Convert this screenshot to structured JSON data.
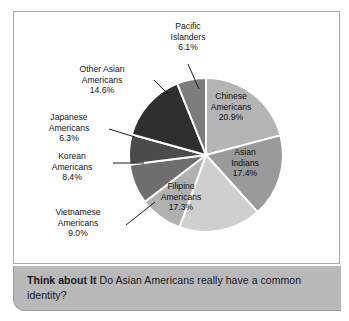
{
  "caption": {
    "lead": "Think about It",
    "question": "Do Asian Americans really have a common identity?"
  },
  "chart_data": {
    "type": "pie",
    "title": "",
    "xlabel": "",
    "ylabel": "",
    "legend_position": "none",
    "grid": false,
    "units": "percent",
    "start_angle_deg": 0,
    "direction": "clockwise",
    "categories": [
      "Chinese Americans",
      "Asian Indians",
      "Filipino Americans",
      "Vietnamese Americans",
      "Korean Americans",
      "Japanese Americans",
      "Other Asian Americans",
      "Pacific Islanders"
    ],
    "values": [
      20.9,
      17.4,
      17.3,
      9.0,
      8.4,
      6.3,
      14.6,
      6.1
    ],
    "value_labels": [
      "20.9%",
      "17.4%",
      "17.3%",
      "9.0%",
      "8.4%",
      "6.3%",
      "14.6%",
      "6.1%"
    ],
    "colors": [
      "#b4b4b4",
      "#9a9a9a",
      "#cfcfcf",
      "#b0b0b0",
      "#6e6e6e",
      "#4b4b4b",
      "#2f2f2f",
      "#7d7d7d"
    ],
    "slice_separator_color": "#ffffff",
    "slices": [
      {
        "name": "Chinese Americans",
        "line1": "Chinese",
        "line2": "Americans",
        "pct": "20.9%",
        "value": 20.9,
        "color": "#b4b4b4",
        "label_placement": "inside"
      },
      {
        "name": "Asian Indians",
        "line1": "Asian",
        "line2": "Indians",
        "pct": "17.4%",
        "value": 17.4,
        "color": "#9a9a9a",
        "label_placement": "inside"
      },
      {
        "name": "Filipino Americans",
        "line1": "Filipino",
        "line2": "Americans",
        "pct": "17.3%",
        "value": 17.3,
        "color": "#cfcfcf",
        "label_placement": "inside"
      },
      {
        "name": "Vietnamese Americans",
        "line1": "Vietnamese",
        "line2": "Americans",
        "pct": "9.0%",
        "value": 9.0,
        "color": "#b0b0b0",
        "label_placement": "outside"
      },
      {
        "name": "Korean Americans",
        "line1": "Korean",
        "line2": "Americans",
        "pct": "8.4%",
        "value": 8.4,
        "color": "#6e6e6e",
        "label_placement": "outside"
      },
      {
        "name": "Japanese Americans",
        "line1": "Japanese",
        "line2": "Americans",
        "pct": "6.3%",
        "value": 6.3,
        "color": "#4b4b4b",
        "label_placement": "outside"
      },
      {
        "name": "Other Asian Americans",
        "line1": "Other Asian",
        "line2": "Americans",
        "pct": "14.6%",
        "value": 14.6,
        "color": "#2f2f2f",
        "label_placement": "outside"
      },
      {
        "name": "Pacific Islanders",
        "line1": "Pacific",
        "line2": "Islanders",
        "pct": "6.1%",
        "value": 6.1,
        "color": "#7d7d7d",
        "label_placement": "outside"
      }
    ]
  }
}
